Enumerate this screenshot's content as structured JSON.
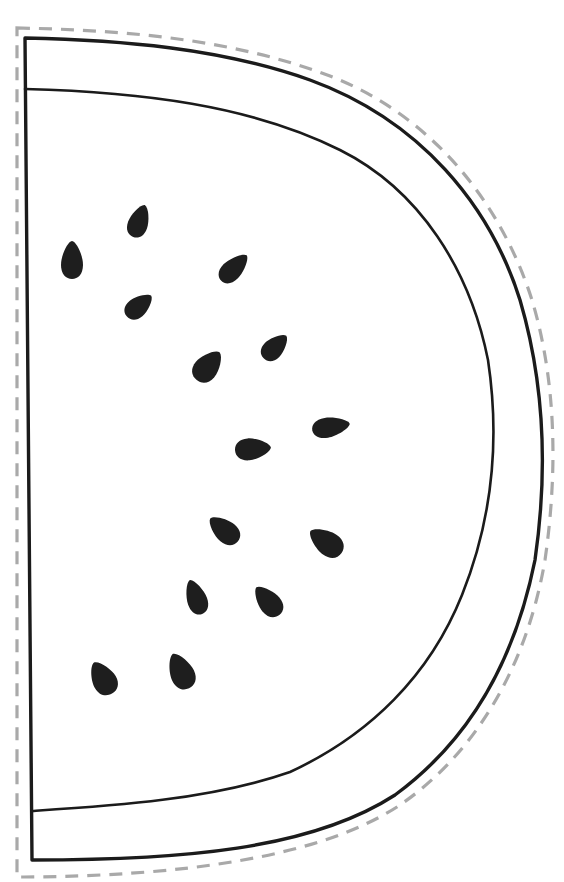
{
  "page": {
    "title": "Watermelon slice template"
  },
  "colors": {
    "background": "#ffffff",
    "outline": "#1b1b1b",
    "seed": "#1e1e1e",
    "cut_line": "#a9a9a9"
  },
  "shapes": {
    "cut_line": {
      "style": "dashed",
      "label": "cut-line"
    },
    "outer_rind": {
      "label": "outer-rind"
    },
    "inner_rind": {
      "label": "inner-rind"
    }
  },
  "seeds": [
    {
      "cx": 72,
      "cy": 260,
      "rx": 11,
      "ry": 19,
      "angle": 0
    },
    {
      "cx": 139,
      "cy": 221,
      "rx": 10,
      "ry": 17,
      "angle": 20
    },
    {
      "cx": 234,
      "cy": 268,
      "rx": 10,
      "ry": 18,
      "angle": 45
    },
    {
      "cx": 139,
      "cy": 306,
      "rx": 10,
      "ry": 16,
      "angle": 50
    },
    {
      "cx": 208,
      "cy": 366,
      "rx": 12,
      "ry": 18,
      "angle": 40
    },
    {
      "cx": 275,
      "cy": 347,
      "rx": 10,
      "ry": 16,
      "angle": 45
    },
    {
      "cx": 253,
      "cy": 449,
      "rx": 11,
      "ry": 18,
      "angle": 85
    },
    {
      "cx": 331,
      "cy": 427,
      "rx": 10,
      "ry": 19,
      "angle": 80
    },
    {
      "cx": 224,
      "cy": 530,
      "rx": 11,
      "ry": 18,
      "angle": -50
    },
    {
      "cx": 326,
      "cy": 542,
      "rx": 12,
      "ry": 19,
      "angle": -55
    },
    {
      "cx": 196,
      "cy": 597,
      "rx": 10,
      "ry": 18,
      "angle": -20
    },
    {
      "cx": 268,
      "cy": 601,
      "rx": 11,
      "ry": 18,
      "angle": -40
    },
    {
      "cx": 103,
      "cy": 678,
      "rx": 12,
      "ry": 18,
      "angle": -30
    },
    {
      "cx": 181,
      "cy": 671,
      "rx": 12,
      "ry": 19,
      "angle": -25
    }
  ]
}
